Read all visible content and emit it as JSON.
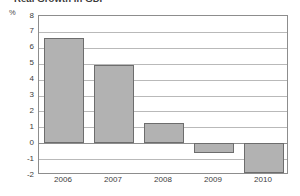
{
  "chart_data": {
    "type": "bar",
    "title": "Real Growth in GDP",
    "subtitle": "",
    "xlabel": "",
    "ylabel": "%",
    "unit_label": "%",
    "categories": [
      "2006",
      "2007",
      "2008",
      "2009",
      "2010"
    ],
    "values": [
      6.6,
      4.9,
      1.3,
      -0.6,
      -1.9
    ],
    "series": [
      {
        "name": "Real Growth in GDP",
        "values": [
          6.6,
          4.9,
          1.3,
          -0.6,
          -1.9
        ]
      }
    ],
    "ylim": [
      -2,
      8
    ],
    "ytick_labels": [
      "8",
      "7",
      "6",
      "5",
      "4",
      "3",
      "2",
      "1",
      "0",
      "-1",
      "-2"
    ],
    "ytick_values": [
      8,
      7,
      6,
      5,
      4,
      3,
      2,
      1,
      0,
      -1,
      -2
    ],
    "grid": true,
    "grid_axis": "y",
    "legend": false,
    "legend_position": "none",
    "bar_color": "#b2b2b2",
    "bar_border_color": "#6d6d6d",
    "gridline_color": "#b9b9b9",
    "axis_color": "#8d8d8d",
    "text_color": "#3d3d3d",
    "background": "#ffffff"
  }
}
